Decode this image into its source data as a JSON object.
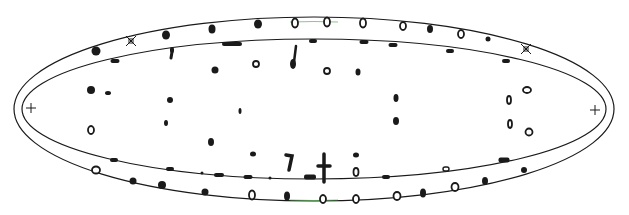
{
  "figure": {
    "width": 629,
    "height": 215,
    "background": "#ffffff",
    "stroke_color": "#1a1a1a",
    "accent_color": "#3aa33a",
    "outer_ellipse": {
      "cx": 314,
      "cy": 109,
      "rx": 300,
      "ry": 92
    },
    "inner_ellipse": {
      "cx": 314,
      "cy": 109,
      "rx": 292,
      "ry": 70
    },
    "plus_markers": [
      {
        "x": 31,
        "y": 108
      },
      {
        "x": 595,
        "y": 110
      }
    ],
    "star_markers": [
      {
        "x": 131,
        "y": 41
      },
      {
        "x": 526,
        "y": 49
      }
    ],
    "outer_dots": [
      {
        "x": 96,
        "y": 51,
        "rx": 4.5,
        "ry": 4.5,
        "hollow": false
      },
      {
        "x": 166,
        "y": 35,
        "rx": 4,
        "ry": 4.5,
        "hollow": false
      },
      {
        "x": 212,
        "y": 29,
        "rx": 3.5,
        "ry": 4.5,
        "hollow": false
      },
      {
        "x": 258,
        "y": 24,
        "rx": 4,
        "ry": 4.5,
        "hollow": false
      },
      {
        "x": 295,
        "y": 23,
        "rx": 3,
        "ry": 4.5,
        "hollow": true
      },
      {
        "x": 327,
        "y": 22,
        "rx": 3,
        "ry": 4.5,
        "hollow": true
      },
      {
        "x": 363,
        "y": 23,
        "rx": 3,
        "ry": 4.5,
        "hollow": true
      },
      {
        "x": 403,
        "y": 26,
        "rx": 3,
        "ry": 4,
        "hollow": true
      },
      {
        "x": 430,
        "y": 29,
        "rx": 3,
        "ry": 4,
        "hollow": false
      },
      {
        "x": 461,
        "y": 34,
        "rx": 3,
        "ry": 4,
        "hollow": true
      },
      {
        "x": 488,
        "y": 39,
        "rx": 2.5,
        "ry": 2.5,
        "hollow": false
      },
      {
        "x": 96,
        "y": 170,
        "rx": 4,
        "ry": 3.5,
        "hollow": true
      },
      {
        "x": 133,
        "y": 181,
        "rx": 3.5,
        "ry": 3.5,
        "hollow": false
      },
      {
        "x": 162,
        "y": 185,
        "rx": 4,
        "ry": 4,
        "hollow": false
      },
      {
        "x": 205,
        "y": 192,
        "rx": 3.5,
        "ry": 3.5,
        "hollow": false
      },
      {
        "x": 252,
        "y": 195,
        "rx": 3,
        "ry": 4.5,
        "hollow": true
      },
      {
        "x": 287,
        "y": 196,
        "rx": 3,
        "ry": 4.5,
        "hollow": false
      },
      {
        "x": 323,
        "y": 199,
        "rx": 3,
        "ry": 4,
        "hollow": true
      },
      {
        "x": 356,
        "y": 199,
        "rx": 3,
        "ry": 4,
        "hollow": true
      },
      {
        "x": 397,
        "y": 196,
        "rx": 3.5,
        "ry": 4,
        "hollow": true
      },
      {
        "x": 423,
        "y": 193,
        "rx": 3,
        "ry": 4.5,
        "hollow": false
      },
      {
        "x": 455,
        "y": 187,
        "rx": 3.5,
        "ry": 4,
        "hollow": true
      },
      {
        "x": 485,
        "y": 181,
        "rx": 3,
        "ry": 4,
        "hollow": false
      },
      {
        "x": 524,
        "y": 170,
        "rx": 3,
        "ry": 3,
        "hollow": false
      }
    ],
    "inner_dashes": [
      {
        "x": 115,
        "y": 61,
        "w": 9,
        "h": 4
      },
      {
        "x": 172,
        "y": 50,
        "w": 4,
        "h": 6
      },
      {
        "x": 232,
        "y": 44,
        "w": 20,
        "h": 4
      },
      {
        "x": 313,
        "y": 41,
        "w": 8,
        "h": 4
      },
      {
        "x": 364,
        "y": 42,
        "w": 9,
        "h": 4
      },
      {
        "x": 393,
        "y": 45,
        "w": 9,
        "h": 4
      },
      {
        "x": 450,
        "y": 51,
        "w": 8,
        "h": 4
      },
      {
        "x": 506,
        "y": 61,
        "w": 8,
        "h": 4
      },
      {
        "x": 114,
        "y": 160,
        "w": 8,
        "h": 4
      },
      {
        "x": 170,
        "y": 169,
        "w": 8,
        "h": 4
      },
      {
        "x": 202,
        "y": 173,
        "w": 3,
        "h": 3
      },
      {
        "x": 219,
        "y": 175,
        "w": 10,
        "h": 4
      },
      {
        "x": 248,
        "y": 177,
        "w": 9,
        "h": 4
      },
      {
        "x": 270,
        "y": 178,
        "w": 3,
        "h": 3
      },
      {
        "x": 310,
        "y": 177,
        "w": 12,
        "h": 5
      },
      {
        "x": 386,
        "y": 177,
        "w": 8,
        "h": 4
      },
      {
        "x": 446,
        "y": 169,
        "w": 6,
        "h": 4,
        "hollow": true
      },
      {
        "x": 504,
        "y": 160,
        "w": 11,
        "h": 5
      }
    ],
    "interior_blobs": [
      {
        "x": 91,
        "y": 90,
        "rx": 4,
        "ry": 4,
        "hollow": false
      },
      {
        "x": 108,
        "y": 93,
        "rx": 3,
        "ry": 2,
        "hollow": false
      },
      {
        "x": 91,
        "y": 130,
        "rx": 3,
        "ry": 4,
        "hollow": true
      },
      {
        "x": 170,
        "y": 100,
        "rx": 3,
        "ry": 3,
        "hollow": false
      },
      {
        "x": 166,
        "y": 123,
        "rx": 2,
        "ry": 3,
        "hollow": false
      },
      {
        "x": 215,
        "y": 70,
        "rx": 3.5,
        "ry": 3.5,
        "hollow": false
      },
      {
        "x": 256,
        "y": 64,
        "rx": 3,
        "ry": 3,
        "hollow": true
      },
      {
        "x": 240,
        "y": 111,
        "rx": 1.5,
        "ry": 3,
        "hollow": false
      },
      {
        "x": 211,
        "y": 142,
        "rx": 3,
        "ry": 4,
        "hollow": false
      },
      {
        "x": 253,
        "y": 154,
        "rx": 3,
        "ry": 2.5,
        "hollow": false
      },
      {
        "x": 293,
        "y": 64,
        "rx": 3,
        "ry": 5,
        "hollow": false
      },
      {
        "x": 327,
        "y": 71,
        "rx": 3,
        "ry": 3,
        "hollow": true
      },
      {
        "x": 358,
        "y": 72,
        "rx": 2.5,
        "ry": 3.5,
        "hollow": false
      },
      {
        "x": 396,
        "y": 98,
        "rx": 2.5,
        "ry": 4,
        "hollow": false
      },
      {
        "x": 396,
        "y": 121,
        "rx": 3,
        "ry": 4,
        "hollow": false
      },
      {
        "x": 356,
        "y": 155,
        "rx": 3,
        "ry": 2.5,
        "hollow": false
      },
      {
        "x": 356,
        "y": 172,
        "rx": 2.5,
        "ry": 4,
        "hollow": true
      },
      {
        "x": 509,
        "y": 100,
        "rx": 2,
        "ry": 4,
        "hollow": true
      },
      {
        "x": 527,
        "y": 90,
        "rx": 4,
        "ry": 3,
        "hollow": true
      },
      {
        "x": 510,
        "y": 124,
        "rx": 2,
        "ry": 4,
        "hollow": true
      },
      {
        "x": 529,
        "y": 132,
        "rx": 3.5,
        "ry": 3.5,
        "hollow": true
      }
    ],
    "strokes": [
      {
        "d": "M296 46 L294 62",
        "w": 2.5
      },
      {
        "d": "M286 155 L292 156 L289 170",
        "w": 3.5
      },
      {
        "d": "M324 154 L324 182 M318 166 L330 166",
        "w": 3.5
      },
      {
        "d": "M172 52 L171 58",
        "w": 3
      }
    ]
  }
}
